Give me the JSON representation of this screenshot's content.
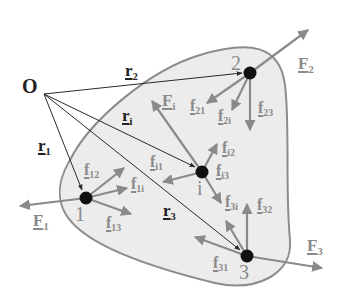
{
  "diagram": {
    "colors": {
      "body_fill": "#ececec",
      "body_stroke": "#8c8c8c",
      "force": "#8a8a8a",
      "position": "#2a2a2a",
      "point": "#111111"
    },
    "origin": {
      "label": "O",
      "x": 44,
      "y": 94
    },
    "points": [
      {
        "id": "1",
        "label": "1",
        "x": 86,
        "y": 198
      },
      {
        "id": "2",
        "label": "2",
        "x": 250,
        "y": 73
      },
      {
        "id": "i",
        "label": "i",
        "x": 202,
        "y": 172
      },
      {
        "id": "3",
        "label": "3",
        "x": 247,
        "y": 256
      }
    ],
    "position_vectors": [
      {
        "label": "r",
        "sub": "1",
        "to": "1"
      },
      {
        "label": "r",
        "sub": "2",
        "to": "2"
      },
      {
        "label": "r",
        "sub": "i",
        "to": "i"
      },
      {
        "label": "r",
        "sub": "3",
        "to": "3"
      }
    ],
    "external_forces": [
      {
        "label": "F",
        "sub": "1",
        "at": "1"
      },
      {
        "label": "F",
        "sub": "2",
        "at": "2"
      },
      {
        "label": "F",
        "sub": "i",
        "at": "i"
      },
      {
        "label": "F",
        "sub": "3",
        "at": "3"
      }
    ],
    "internal_forces": [
      {
        "label": "f",
        "sub": "12"
      },
      {
        "label": "f",
        "sub": "1i"
      },
      {
        "label": "f",
        "sub": "13"
      },
      {
        "label": "f",
        "sub": "21"
      },
      {
        "label": "f",
        "sub": "2i"
      },
      {
        "label": "f",
        "sub": "23"
      },
      {
        "label": "f",
        "sub": "i1"
      },
      {
        "label": "f",
        "sub": "i2"
      },
      {
        "label": "f",
        "sub": "i3"
      },
      {
        "label": "f",
        "sub": "31"
      },
      {
        "label": "f",
        "sub": "3i"
      },
      {
        "label": "f",
        "sub": "32"
      }
    ]
  }
}
